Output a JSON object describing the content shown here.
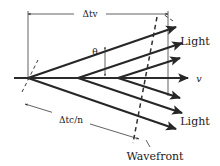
{
  "figure": {
    "background_color": "#ffffff",
    "ink_color": "#262626",
    "width": 220,
    "height": 166,
    "labels": {
      "top_dimension": "Δtv",
      "bottom_dimension": "Δtc/n",
      "angle": "θ",
      "velocity": "v",
      "light_upper": "Light",
      "light_lower": "Light",
      "wavefront": "Wavefront"
    },
    "geometry": {
      "axis_y": 78,
      "apexes_x": [
        28,
        78,
        118
      ],
      "cone_half_angle_deg": 27,
      "top_dim_y": 14,
      "top_dim_x_start": 28,
      "top_dim_x_end": 168,
      "bottom_dim_x_start": 25,
      "bottom_dim_x_end": 140,
      "ray_count_upper": 3,
      "ray_count_lower": 3,
      "wavefront_dashed_lines": 2
    }
  }
}
